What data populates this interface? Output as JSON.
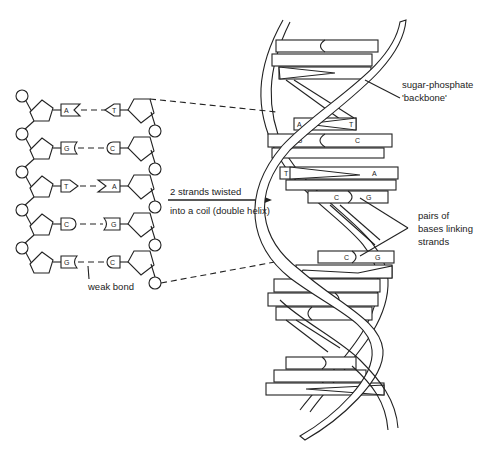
{
  "diagram": {
    "labels": {
      "backbone_line1": "sugar-phosphate",
      "backbone_line2": "'backbone'",
      "arrow_line1": "2 strands twisted",
      "arrow_line2": "into a coil (double helix)",
      "pairs_line1": "pairs of",
      "pairs_line2": "bases linking",
      "pairs_line3": "strands",
      "weak_bond": "weak bond"
    },
    "flat_strand_pairs": [
      {
        "left": "A",
        "right": "T"
      },
      {
        "left": "G",
        "right": "C"
      },
      {
        "left": "T",
        "right": "A"
      },
      {
        "left": "C",
        "right": "G"
      },
      {
        "left": "G",
        "right": "C"
      }
    ],
    "helix_labeled_pairs": [
      {
        "left": "A",
        "right": "T"
      },
      {
        "left": "G",
        "right": "C"
      },
      {
        "left": "T",
        "right": "A"
      },
      {
        "left": "C",
        "right": "G"
      },
      {
        "left": "C",
        "right": "G"
      }
    ],
    "colors": {
      "line": "#222222",
      "background": "#ffffff"
    }
  }
}
